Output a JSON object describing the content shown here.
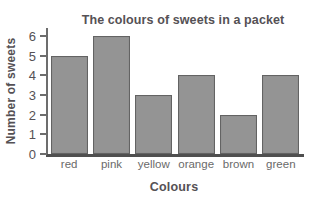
{
  "chart_data": {
    "type": "bar",
    "title": "The colours of sweets in a packet",
    "xlabel": "Colours",
    "ylabel": "Number of sweets",
    "categories": [
      "red",
      "pink",
      "yellow",
      "orange",
      "brown",
      "green"
    ],
    "values": [
      5,
      6,
      3,
      4,
      2,
      4
    ],
    "ytick_labels": [
      "0",
      "1",
      "2",
      "3",
      "4",
      "5",
      "6"
    ],
    "ytick_values": [
      0,
      1,
      2,
      3,
      4,
      5,
      6
    ],
    "ylim": [
      0,
      6.4
    ],
    "grid": false,
    "legend": false,
    "legend_position": "none",
    "bar_fill_color": "#949494",
    "bar_edge_color": "#636363",
    "axis_color": "#6d6d6d",
    "text_color": "#555155",
    "background_color": "#ffffff"
  }
}
